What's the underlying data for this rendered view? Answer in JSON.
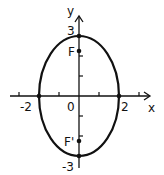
{
  "diagram": {
    "type": "ellipse-graph",
    "equation_shape": "vertical ellipse centered at origin",
    "semi_major_axis": 3,
    "semi_minor_axis": 2,
    "axes": {
      "x_label": "x",
      "y_label": "y",
      "origin_label": "0"
    },
    "tick_labels": {
      "x_neg": "-2",
      "x_pos": "2",
      "y_pos": "3",
      "y_neg": "-3"
    },
    "foci": {
      "upper_label": "F",
      "lower_label": "F'"
    },
    "colors": {
      "stroke": "#111111",
      "background": "#ffffff"
    }
  }
}
